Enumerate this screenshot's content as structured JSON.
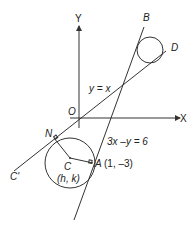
{
  "diagram": {
    "axes": {
      "x_label": "X",
      "y_label": "Y",
      "origin_label": "O"
    },
    "lines": [
      {
        "id": "y-equals-x",
        "equation": "y = x",
        "end_labels": [
          "C'",
          "D"
        ]
      },
      {
        "id": "tangent-3x-y-6",
        "equation": "3x –y = 6",
        "end_label": "B"
      }
    ],
    "points": {
      "N": "N",
      "C": "C",
      "C_coords": "(h, k)",
      "A": "A",
      "A_coords": "(1, –3)",
      "B": "B",
      "D": "D",
      "C_prime": "C'"
    },
    "colors": {
      "stroke": "#333333",
      "text": "#222222",
      "background": "#ffffff"
    }
  }
}
